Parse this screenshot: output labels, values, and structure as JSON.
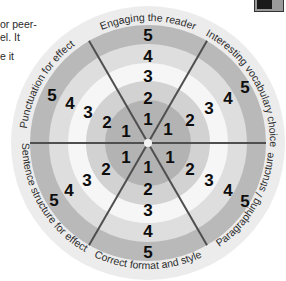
{
  "side_text": {
    "lines": [
      "or peer-",
      "el. It",
      "",
      "e it"
    ]
  },
  "wheel": {
    "center": [
      148,
      143
    ],
    "radii": {
      "r1": 43,
      "r2": 62,
      "r3": 80,
      "r4": 99,
      "r5": 118,
      "outer": 137
    },
    "ring_colors": {
      "outer": "#ececec",
      "ring5": "#b9b9b9",
      "ring4": "#dedede",
      "ring3": "#f6f6f6",
      "ring2": "#d2d2d2",
      "ring1": "#b3b3b3"
    },
    "divider_color": "#555555",
    "levels": [
      "1",
      "2",
      "3",
      "4",
      "5"
    ],
    "sectors": [
      {
        "label": "Engaging the reader"
      },
      {
        "label": "Interesting vocabulary choice"
      },
      {
        "label": "Paragraphing / structure"
      },
      {
        "label": "Correct format and style"
      },
      {
        "label": "Sentence structure for effect"
      },
      {
        "label": "Punctuation for effect"
      }
    ]
  },
  "corner_icon": {
    "name": "partial-toolbar-icon"
  }
}
